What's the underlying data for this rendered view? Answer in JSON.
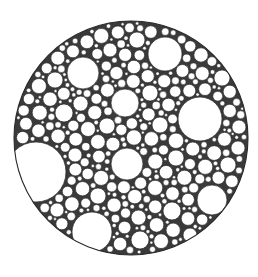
{
  "canvas": {
    "width": 258,
    "height": 277,
    "background": "#ffffff"
  },
  "diagram": {
    "type": "circle-packing",
    "stroke_color": "#2a2a2a",
    "gap_fill": "#3a3a3a",
    "circle_fill": "#ffffff",
    "container": {
      "cx": 131,
      "cy": 138,
      "r": 117
    },
    "major_circles": [
      {
        "cx": 36,
        "cy": 172,
        "r": 30
      },
      {
        "cx": 83,
        "cy": 73,
        "r": 16
      },
      {
        "cx": 165,
        "cy": 54,
        "r": 17
      },
      {
        "cx": 200,
        "cy": 119,
        "r": 22
      },
      {
        "cx": 125,
        "cy": 103,
        "r": 14
      },
      {
        "cx": 127,
        "cy": 164,
        "r": 16
      },
      {
        "cx": 92,
        "cy": 232,
        "r": 20
      },
      {
        "cx": 212,
        "cy": 200,
        "r": 15
      },
      {
        "cx": 64,
        "cy": 113,
        "r": 9
      },
      {
        "cx": 55,
        "cy": 80,
        "r": 8
      },
      {
        "cx": 137,
        "cy": 40,
        "r": 8
      },
      {
        "cx": 107,
        "cy": 126,
        "r": 8
      },
      {
        "cx": 150,
        "cy": 93,
        "r": 8
      },
      {
        "cx": 176,
        "cy": 158,
        "r": 8
      },
      {
        "cx": 172,
        "cy": 211,
        "r": 9
      },
      {
        "cx": 140,
        "cy": 240,
        "r": 9
      },
      {
        "cx": 98,
        "cy": 196,
        "r": 8
      },
      {
        "cx": 160,
        "cy": 125,
        "r": 8
      },
      {
        "cx": 228,
        "cy": 165,
        "r": 8
      },
      {
        "cx": 75,
        "cy": 155,
        "r": 7
      },
      {
        "cx": 222,
        "cy": 78,
        "r": 8
      },
      {
        "cx": 190,
        "cy": 235,
        "r": 7
      },
      {
        "cx": 57,
        "cy": 210,
        "r": 7
      },
      {
        "cx": 110,
        "cy": 50,
        "r": 7
      }
    ],
    "fill_settings": {
      "min_r": 1.4,
      "max_r": 7,
      "seed": 7,
      "attempts": 60000
    }
  }
}
